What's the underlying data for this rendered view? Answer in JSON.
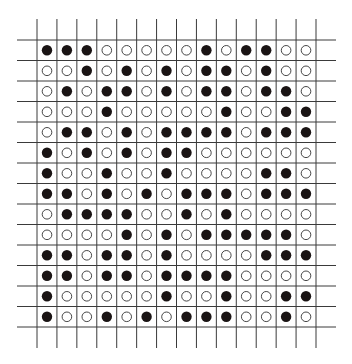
{
  "diagram": {
    "type": "dot-grid",
    "rows": 14,
    "cols": 14,
    "legend": {
      "1": "filled-circle",
      "0": "empty-circle"
    },
    "colors": {
      "line": "#3a3a3a",
      "filled": "#1a1414",
      "empty_stroke": "#333333",
      "background": "#ffffff"
    },
    "cells": [
      [
        1,
        1,
        1,
        0,
        0,
        0,
        0,
        0,
        1,
        0,
        1,
        1,
        0,
        0
      ],
      [
        0,
        0,
        1,
        0,
        1,
        0,
        1,
        0,
        1,
        1,
        0,
        1,
        0,
        0
      ],
      [
        0,
        1,
        0,
        1,
        1,
        0,
        1,
        0,
        1,
        1,
        0,
        1,
        1,
        0
      ],
      [
        0,
        0,
        0,
        1,
        0,
        0,
        0,
        0,
        0,
        1,
        0,
        0,
        1,
        1
      ],
      [
        0,
        1,
        1,
        0,
        1,
        0,
        1,
        1,
        1,
        1,
        0,
        1,
        1,
        1
      ],
      [
        1,
        0,
        1,
        0,
        1,
        0,
        1,
        1,
        0,
        0,
        0,
        0,
        0,
        0
      ],
      [
        1,
        0,
        0,
        1,
        0,
        0,
        1,
        0,
        0,
        0,
        0,
        1,
        1,
        0
      ],
      [
        1,
        1,
        0,
        1,
        0,
        1,
        0,
        1,
        1,
        1,
        0,
        1,
        1,
        1
      ],
      [
        0,
        1,
        1,
        1,
        1,
        0,
        0,
        1,
        0,
        1,
        0,
        0,
        0,
        0
      ],
      [
        0,
        0,
        0,
        0,
        1,
        0,
        1,
        0,
        1,
        1,
        1,
        1,
        1,
        0
      ],
      [
        1,
        1,
        0,
        1,
        1,
        0,
        1,
        0,
        0,
        0,
        0,
        1,
        1,
        1
      ],
      [
        1,
        1,
        0,
        1,
        1,
        0,
        1,
        1,
        1,
        1,
        0,
        0,
        0,
        0
      ],
      [
        1,
        0,
        0,
        0,
        0,
        0,
        1,
        0,
        0,
        1,
        0,
        0,
        1,
        1
      ],
      [
        1,
        0,
        0,
        1,
        0,
        1,
        0,
        1,
        1,
        1,
        0,
        0,
        1,
        0
      ]
    ]
  }
}
